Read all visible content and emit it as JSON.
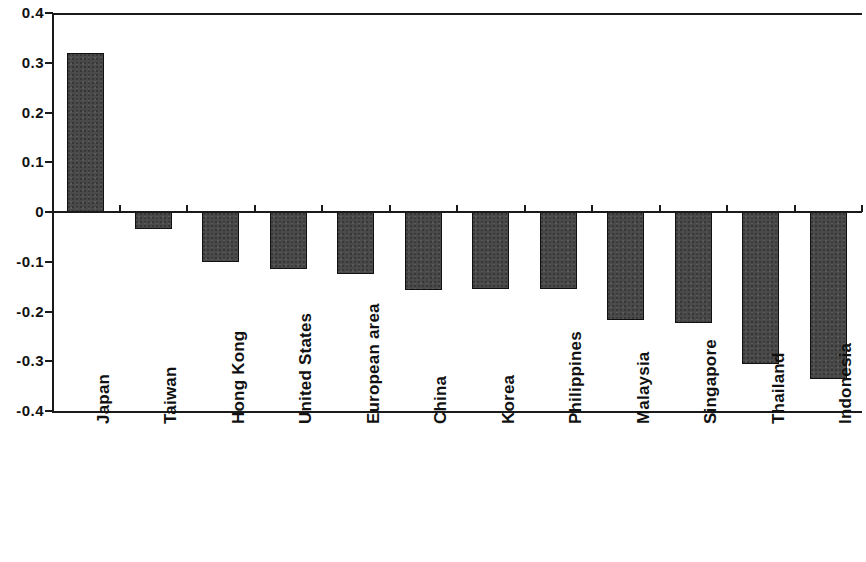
{
  "chart_data": {
    "type": "bar",
    "title": "",
    "subtitle": "",
    "xlabel": "",
    "ylabel": "",
    "ylim": [
      -0.4,
      0.4
    ],
    "grid": false,
    "legend": "none",
    "orientation": "vertical",
    "bar_color": "#4a4a4a",
    "bar_edge_color": "#111111",
    "axis_color": "#1a1a1a",
    "background_color": "#ffffff",
    "ytick_labels": [
      "0.4",
      "0.3",
      "0.2",
      "0.1",
      "0",
      "-0.1",
      "-0.2",
      "-0.3",
      "-0.4"
    ],
    "ytick_values": [
      0.4,
      0.3,
      0.2,
      0.1,
      0,
      -0.1,
      -0.2,
      -0.3,
      -0.4
    ],
    "categories": [
      "Japan",
      "Taiwan",
      "Hong Kong",
      "United States",
      "European area",
      "China",
      "Korea",
      "Philippines",
      "Malaysia",
      "Singapore",
      "Thailand",
      "Indonesia"
    ],
    "values": [
      0.32,
      -0.035,
      -0.1,
      -0.115,
      -0.125,
      -0.157,
      -0.155,
      -0.155,
      -0.217,
      -0.223,
      -0.305,
      -0.335
    ]
  }
}
